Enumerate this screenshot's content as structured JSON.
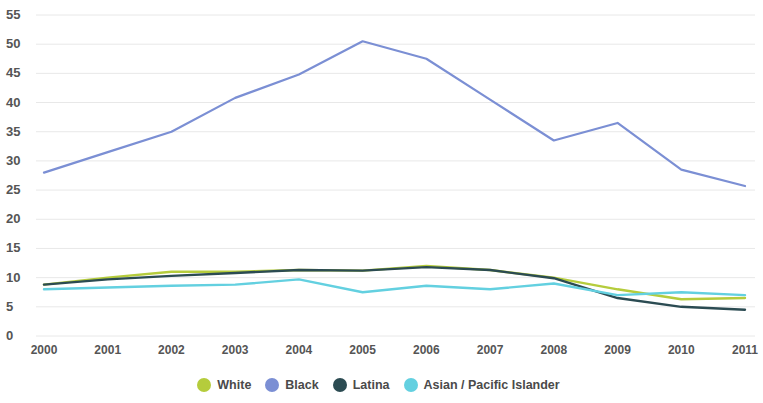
{
  "chart_data": {
    "type": "line",
    "title": "",
    "subtitle": "",
    "xlabel": "",
    "ylabel": "",
    "categories": [
      "2000",
      "2001",
      "2002",
      "2003",
      "2004",
      "2005",
      "2006",
      "2007",
      "2008",
      "2009",
      "2010",
      "2011"
    ],
    "x": [
      2000,
      2001,
      2002,
      2003,
      2004,
      2005,
      2006,
      2007,
      2008,
      2009,
      2010,
      2011
    ],
    "ylim": [
      0,
      55
    ],
    "xlim": [
      2000,
      2011
    ],
    "y_ticks": [
      0,
      5,
      10,
      15,
      20,
      25,
      30,
      35,
      40,
      45,
      50,
      55
    ],
    "y_tick_labels": [
      "0",
      "5",
      "10",
      "15",
      "20",
      "25",
      "30",
      "35",
      "40",
      "45",
      "50",
      "55"
    ],
    "grid": true,
    "grid_axis": "y",
    "legend_position": "bottom",
    "series": [
      {
        "name": "White",
        "color": "#b5cc3c",
        "values": [
          8.8,
          10.0,
          11.0,
          11.0,
          11.3,
          11.2,
          12.0,
          11.3,
          10.0,
          8.0,
          6.3,
          6.5
        ]
      },
      {
        "name": "Black",
        "color": "#7b8fd4",
        "values": [
          28.0,
          31.5,
          35.0,
          40.8,
          44.8,
          50.5,
          47.5,
          40.5,
          33.5,
          36.5,
          28.5,
          25.7
        ]
      },
      {
        "name": "Latina",
        "color": "#2b4b52",
        "values": [
          8.8,
          9.7,
          10.3,
          10.8,
          11.3,
          11.2,
          11.8,
          11.3,
          9.9,
          6.5,
          5.0,
          4.5
        ]
      },
      {
        "name": "Asian / Pacific Islander",
        "color": "#63d0e0",
        "values": [
          8.0,
          8.3,
          8.6,
          8.8,
          9.7,
          7.5,
          8.6,
          8.0,
          9.0,
          7.0,
          7.5,
          7.0
        ]
      }
    ]
  },
  "legend": {
    "items": [
      {
        "label": "White",
        "color": "#b5cc3c"
      },
      {
        "label": "Black",
        "color": "#7b8fd4"
      },
      {
        "label": "Latina",
        "color": "#2b4b52"
      },
      {
        "label": "Asian / Pacific Islander",
        "color": "#63d0e0"
      }
    ]
  },
  "axes": {
    "y_tick_labels": [
      "55",
      "50",
      "45",
      "40",
      "35",
      "30",
      "25",
      "20",
      "15",
      "10",
      "5",
      "0"
    ],
    "x_tick_labels": [
      "2000",
      "2001",
      "2002",
      "2003",
      "2004",
      "2005",
      "2006",
      "2007",
      "2008",
      "2009",
      "2010",
      "2011"
    ]
  },
  "style": {
    "grid_color": "#e8e8e8",
    "axis_text_color": "#555555",
    "background": "#ffffff"
  }
}
